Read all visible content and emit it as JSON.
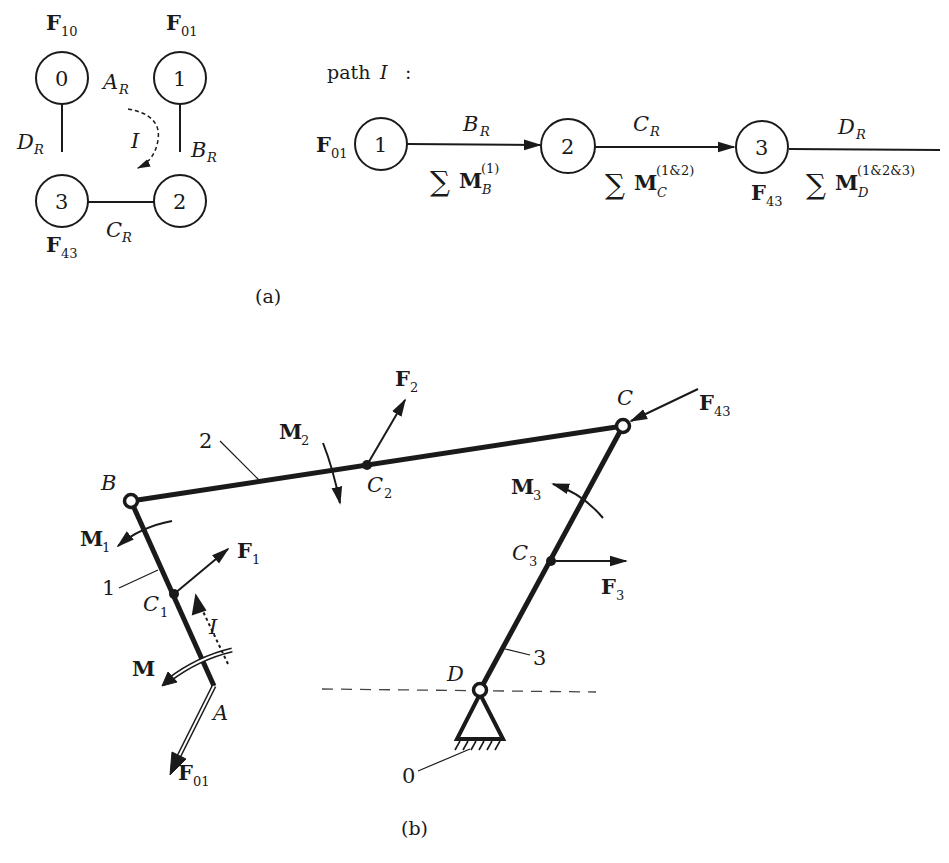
{
  "figure": {
    "panel_a": {
      "caption": "(a)",
      "graph": {
        "nodes": [
          {
            "id": "0",
            "label": "0",
            "force": "F",
            "force_sub": "10"
          },
          {
            "id": "1",
            "label": "1",
            "force": "F",
            "force_sub": "01"
          },
          {
            "id": "2",
            "label": "2"
          },
          {
            "id": "3",
            "label": "3",
            "force": "F",
            "force_sub": "43"
          }
        ],
        "edges": [
          {
            "main": "A",
            "sub": "R"
          },
          {
            "main": "B",
            "sub": "R"
          },
          {
            "main": "C",
            "sub": "R"
          },
          {
            "main": "D",
            "sub": "R"
          }
        ],
        "loop_label": "I"
      },
      "path": {
        "title_prefix": "path",
        "title_var": "I",
        "title_suffix": ":",
        "start_force": "F",
        "start_force_sub": "01",
        "nodes": [
          "1",
          "2",
          "3"
        ],
        "node3_force": "F",
        "node3_force_sub": "43",
        "segments": [
          {
            "joint": "B",
            "joint_sub": "R",
            "sum": "∑",
            "moment": "M",
            "moment_sub": "B",
            "moment_sup": "(1)"
          },
          {
            "joint": "C",
            "joint_sub": "R",
            "sum": "∑",
            "moment": "M",
            "moment_sub": "C",
            "moment_sup": "(1&2)"
          },
          {
            "joint": "D",
            "joint_sub": "R",
            "sum": "∑",
            "moment": "M",
            "moment_sub": "D",
            "moment_sup": "(1&2&3)"
          }
        ]
      }
    },
    "panel_b": {
      "caption": "(b)",
      "joints": {
        "A": "A",
        "B": "B",
        "C": "C",
        "D": "D"
      },
      "link_labels": {
        "link0": "0",
        "link1": "1",
        "link2": "2",
        "link3": "3"
      },
      "centers": [
        {
          "main": "C",
          "sub": "1"
        },
        {
          "main": "C",
          "sub": "2"
        },
        {
          "main": "C",
          "sub": "3"
        }
      ],
      "forces": [
        {
          "main": "F",
          "sub": "1"
        },
        {
          "main": "F",
          "sub": "2"
        },
        {
          "main": "F",
          "sub": "3"
        },
        {
          "main": "F",
          "sub": "43"
        },
        {
          "main": "F",
          "sub": "01"
        }
      ],
      "moments": [
        {
          "main": "M",
          "sub": "1"
        },
        {
          "main": "M",
          "sub": "2"
        },
        {
          "main": "M",
          "sub": "3"
        },
        {
          "main": "M",
          "sub": ""
        }
      ],
      "path_label": "I"
    },
    "colors": {
      "ink": "#1a1a1a",
      "background": "#ffffff",
      "dashed": "#444444"
    }
  }
}
